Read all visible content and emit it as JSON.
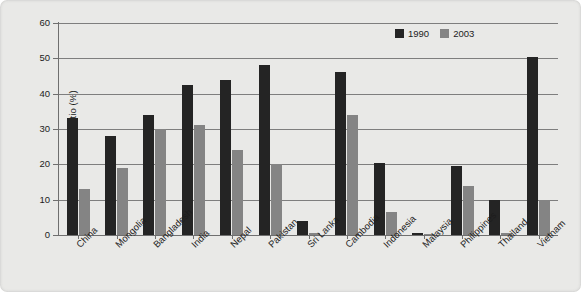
{
  "chart_data": {
    "type": "bar",
    "title": "",
    "xlabel": "",
    "ylabel": "Headcount ratio (%)",
    "ylim": [
      0,
      60
    ],
    "ytick_labels": [
      "0",
      "10",
      "20",
      "30",
      "40",
      "50",
      "60"
    ],
    "ytick_values": [
      0,
      10,
      20,
      30,
      40,
      50,
      60
    ],
    "grid": true,
    "legend_position": "top-right",
    "categories": [
      "China",
      "Mongolia",
      "Bangladesh",
      "India",
      "Nepal",
      "Pakistan",
      "Sri Lanka",
      "Cambodia",
      "Indonesia",
      "Malaysia",
      "Philippines",
      "Thailand",
      "Vietnam"
    ],
    "series": [
      {
        "name": "1990",
        "color": "#242424",
        "values": [
          33,
          28,
          34,
          42.5,
          44,
          48,
          4,
          46,
          20.5,
          0.7,
          19.5,
          10,
          50.5
        ]
      },
      {
        "name": "2003",
        "color": "#848484",
        "values": [
          13,
          19,
          30,
          31,
          24,
          20,
          0.6,
          34,
          6.5,
          0.2,
          14,
          0.6,
          10
        ]
      }
    ]
  },
  "legend": {
    "entries": [
      {
        "label": "1990"
      },
      {
        "label": "2003"
      }
    ]
  }
}
